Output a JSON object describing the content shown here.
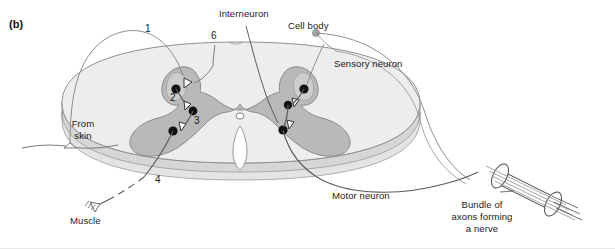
{
  "figure": {
    "panel_tag": "(b)",
    "type": "diagram",
    "width": 615,
    "height": 249
  },
  "labels": {
    "interneuron": "Interneuron",
    "cell_body": "Cell body",
    "sensory_neuron": "Sensory neuron",
    "motor_neuron": "Motor neuron",
    "from_skin_line1": "From",
    "from_skin_line2": "skin",
    "muscle": "Muscle",
    "bundle_line1": "Bundle of",
    "bundle_line2": "axons forming",
    "bundle_line3": "a nerve"
  },
  "numbers": {
    "n1": "1",
    "n2": "2",
    "n3": "3",
    "n4": "4",
    "n6": "6"
  },
  "colors": {
    "white_matter": "#ededed",
    "white_matter_stroke": "#8f8f8f",
    "gray_matter": "#b9b9b9",
    "gray_matter_stroke": "#8a8a8a",
    "disc_edge": "#cfcfcf",
    "neuron_stroke": "#5b5b5b",
    "cell_body_fill": "#111111",
    "marker_dot": "#9a9a9a",
    "text": "#1a1a1a",
    "background": "#ffffff"
  }
}
